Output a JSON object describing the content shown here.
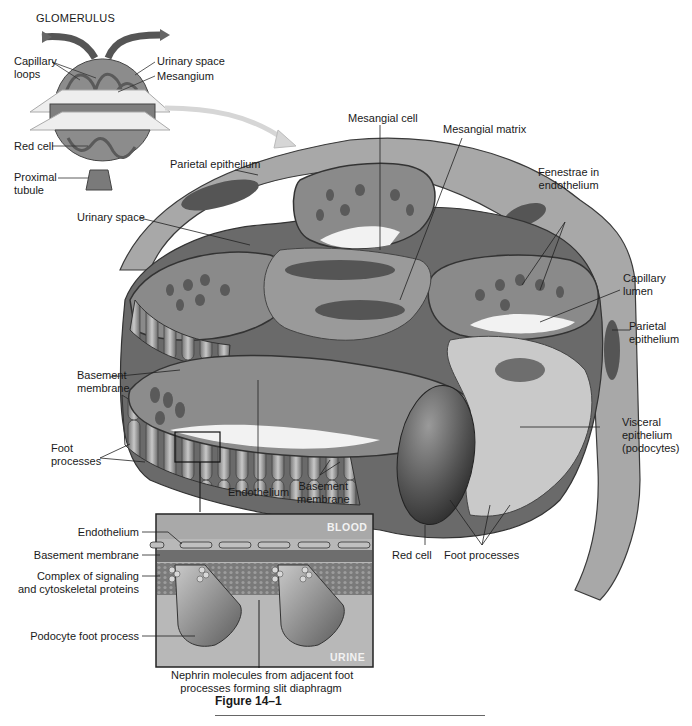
{
  "glomerulus": {
    "title": "GLOMERULUS",
    "labels": {
      "capillary_loops": [
        "Capillary",
        "loops"
      ],
      "urinary_space": "Urinary space",
      "mesangium": "Mesangium",
      "red_cell": "Red cell",
      "proximal_tubule": [
        "Proximal",
        "tubule"
      ]
    }
  },
  "detail": {
    "labels": {
      "mesangial_cell": "Mesangial cell",
      "mesangial_matrix": "Mesangial matrix",
      "parietal_epithelium_top": "Parietal epithelium",
      "fenestrae": [
        "Fenestrae in",
        "endothelium"
      ],
      "urinary_space": "Urinary space",
      "capillary_lumen": [
        "Capillary",
        "lumen"
      ],
      "parietal_epithelium_right": [
        "Parietal",
        "epithelium"
      ],
      "basement_membrane_left": [
        "Basement",
        "membrane"
      ],
      "visceral_epithelium": [
        "Visceral",
        "epithelium",
        "(podocytes)"
      ],
      "foot_processes_left": [
        "Foot",
        "processes"
      ],
      "endothelium": "Endothelium",
      "basement_membrane_bottom": [
        "Basement",
        "membrane"
      ],
      "red_cell": "Red cell",
      "foot_processes_bottom": "Foot processes"
    }
  },
  "inset": {
    "blood_tag": "BLOOD",
    "urine_tag": "URINE",
    "labels": {
      "endothelium": "Endothelium",
      "basement_membrane": "Basement membrane",
      "complex": [
        "Complex of signaling",
        "and cytoskeletal proteins"
      ],
      "podocyte_foot_process": "Podocyte foot process",
      "nephrin": [
        "Nephrin molecules from adjacent foot",
        "processes forming slit diaphragm"
      ]
    }
  },
  "figure_caption": "Figure 14–1",
  "colors": {
    "dark_tissue": "#5a5a5a",
    "mid_tissue": "#8a8a8a",
    "light_tissue": "#c4c4c4",
    "pale": "#e4e4e4",
    "inset_bg": "#b5b5b5",
    "basement": "#6e6e6e"
  }
}
